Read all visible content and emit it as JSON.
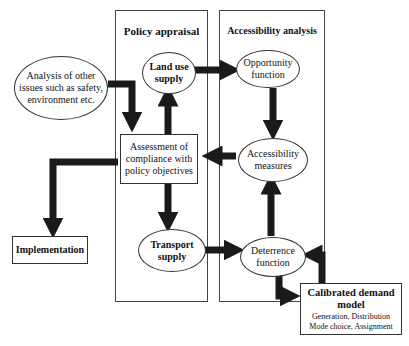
{
  "panels": {
    "policy": {
      "title": "Policy appraisal"
    },
    "access": {
      "title": "Accessibility analysis"
    }
  },
  "nodes": {
    "other_issues": "Analysis of other\nissues such as safety,\nenvironment etc.",
    "land_use": "Land use\nsupply",
    "assessment": "Assessment of\ncompliance with\npolicy objectives",
    "transport": "Transport\nsupply",
    "implementation": "Implementation",
    "opportunity": "Opportunity\nfunction",
    "accessibility": "Accessibility\nmeasures",
    "deterrence": "Deterrence\nfunction",
    "demand_title": "Calibrated demand\nmodel",
    "demand_sub": "Generation, Distribution\nMode choice, Assignment"
  },
  "colors": {
    "arrow": "#1a1a1a",
    "border": "#333333"
  }
}
